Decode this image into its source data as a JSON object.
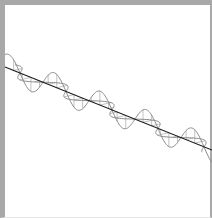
{
  "diagram": {
    "type": "electromagnetic-wave",
    "colors": {
      "frame": "#a8a8a8",
      "background": "#ffffff",
      "axis": "#1a1a1a",
      "wave_vertical": "#8a8a8a",
      "wave_horizontal": "#8a8a8a",
      "vectors": "#9a9a9a"
    },
    "axis": {
      "x1": 5,
      "y1": 67,
      "x2": 212,
      "y2": 150
    },
    "cycles": 4.5,
    "vertical_amplitude": 14,
    "horizontal_amplitude": 7
  }
}
